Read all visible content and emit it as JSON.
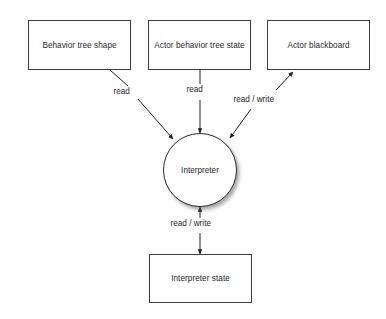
{
  "diagram": {
    "background_color": "#fefefe",
    "stroke_color": "#3c3c3c",
    "text_color": "#1f1f1f",
    "nodes": [
      {
        "id": "behavior-tree-shape",
        "label": "Behavior tree shape",
        "shape": "rectangle"
      },
      {
        "id": "actor-behavior-tree-state",
        "label": "Actor behavior tree state",
        "shape": "rectangle"
      },
      {
        "id": "actor-blackboard",
        "label": "Actor blackboard",
        "shape": "rectangle"
      },
      {
        "id": "interpreter",
        "label": "Interpreter",
        "shape": "circle"
      },
      {
        "id": "interpreter-state",
        "label": "Interpreter state",
        "shape": "rectangle"
      }
    ],
    "edges": [
      {
        "id": "shape-to-interpreter",
        "from": "behavior-tree-shape",
        "to": "interpreter",
        "label": "read",
        "direction": "one-way"
      },
      {
        "id": "state-to-interpreter",
        "from": "actor-behavior-tree-state",
        "to": "interpreter",
        "label": "read",
        "direction": "one-way"
      },
      {
        "id": "blackboard-interpreter",
        "from": "actor-blackboard",
        "to": "interpreter",
        "label": "read / write",
        "direction": "two-way"
      },
      {
        "id": "interpreter-interpreter-state",
        "from": "interpreter",
        "to": "interpreter-state",
        "label": "read / write",
        "direction": "two-way"
      }
    ]
  }
}
